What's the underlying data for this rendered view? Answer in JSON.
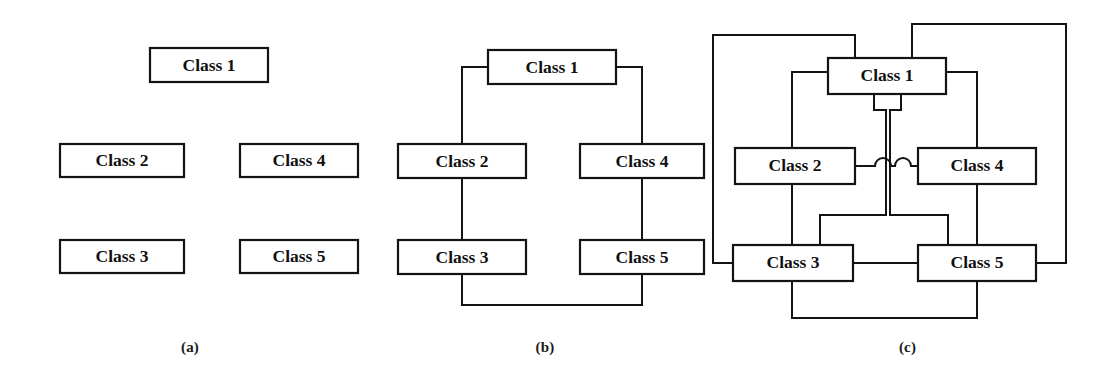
{
  "figure": {
    "background_color": "#ffffff",
    "line_color": "#131313",
    "text_color": "#101010",
    "panel_count": 3
  },
  "nodes": {
    "class1": "Class 1",
    "class2": "Class 2",
    "class3": "Class 3",
    "class4": "Class 4",
    "class5": "Class 5"
  },
  "panels": [
    {
      "id": "a",
      "caption": "(a)",
      "description": "Five class boxes with no connections",
      "edge_count": 0,
      "boxes": [
        {
          "label": "Class 1",
          "x": 150,
          "y": 48,
          "w": 118,
          "h": 34
        },
        {
          "label": "Class 2",
          "x": 60,
          "y": 144,
          "w": 124,
          "h": 33
        },
        {
          "label": "Class 4",
          "x": 240,
          "y": 144,
          "w": 118,
          "h": 33
        },
        {
          "label": "Class 3",
          "x": 60,
          "y": 240,
          "w": 124,
          "h": 33
        },
        {
          "label": "Class 5",
          "x": 240,
          "y": 240,
          "w": 118,
          "h": 33
        }
      ],
      "edges": []
    },
    {
      "id": "b",
      "caption": "(b)",
      "description": "Five class boxes connected in a ring / tree with four orthogonal links",
      "edge_count": 5,
      "boxes": [
        {
          "label": "Class 1",
          "x": 108,
          "y": 50,
          "w": 128,
          "h": 34
        },
        {
          "label": "Class 2",
          "x": 18,
          "y": 144,
          "w": 128,
          "h": 34
        },
        {
          "label": "Class 4",
          "x": 200,
          "y": 144,
          "w": 124,
          "h": 34
        },
        {
          "label": "Class 3",
          "x": 18,
          "y": 240,
          "w": 128,
          "h": 34
        },
        {
          "label": "Class 5",
          "x": 200,
          "y": 240,
          "w": 124,
          "h": 34
        }
      ],
      "edges": [
        {
          "from": "Class 1",
          "to": "Class 2"
        },
        {
          "from": "Class 1",
          "to": "Class 4"
        },
        {
          "from": "Class 2",
          "to": "Class 3"
        },
        {
          "from": "Class 4",
          "to": "Class 5"
        },
        {
          "from": "Class 3",
          "to": "Class 5"
        }
      ]
    },
    {
      "id": "c",
      "caption": "(c)",
      "description": "Five class boxes fully connected; ten links routed orthogonally with semicircular hops where lines cross",
      "edge_count": 10,
      "hop_count": 2,
      "boxes": [
        {
          "label": "Class 1",
          "x": 128,
          "y": 58,
          "w": 118,
          "h": 36
        },
        {
          "label": "Class 2",
          "x": 35,
          "y": 148,
          "w": 120,
          "h": 36
        },
        {
          "label": "Class 4",
          "x": 218,
          "y": 148,
          "w": 118,
          "h": 36
        },
        {
          "label": "Class 3",
          "x": 33,
          "y": 245,
          "w": 120,
          "h": 36
        },
        {
          "label": "Class 5",
          "x": 218,
          "y": 245,
          "w": 118,
          "h": 36
        }
      ],
      "edges": [
        {
          "from": "Class 1",
          "to": "Class 2"
        },
        {
          "from": "Class 1",
          "to": "Class 3"
        },
        {
          "from": "Class 1",
          "to": "Class 4"
        },
        {
          "from": "Class 1",
          "to": "Class 5"
        },
        {
          "from": "Class 2",
          "to": "Class 3"
        },
        {
          "from": "Class 2",
          "to": "Class 4"
        },
        {
          "from": "Class 2",
          "to": "Class 5"
        },
        {
          "from": "Class 3",
          "to": "Class 4"
        },
        {
          "from": "Class 3",
          "to": "Class 5"
        },
        {
          "from": "Class 4",
          "to": "Class 5"
        }
      ]
    }
  ]
}
